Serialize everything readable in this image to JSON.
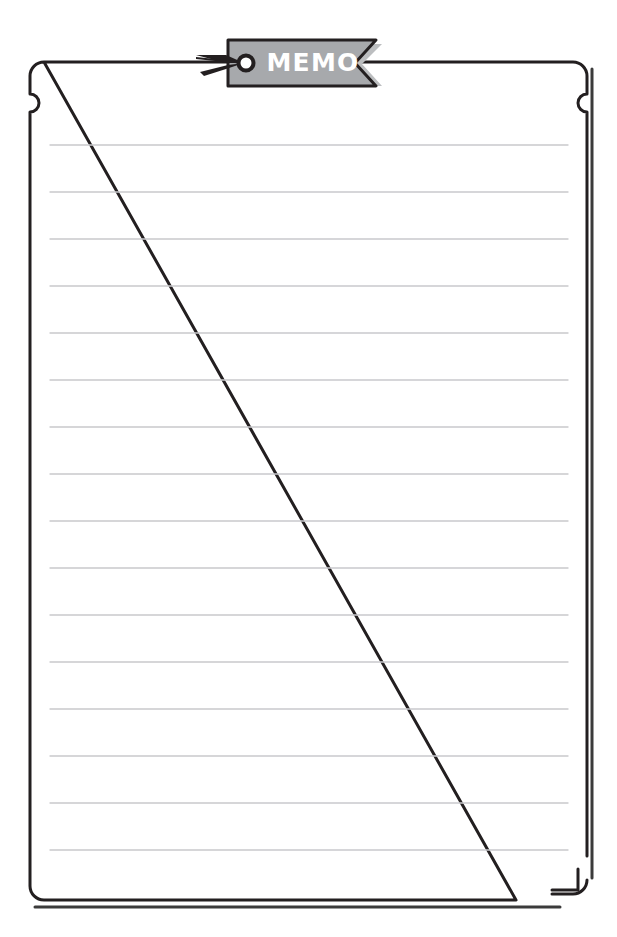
{
  "page": {
    "title": "MEMO",
    "width": 617,
    "height": 937,
    "background_color": "#ffffff"
  },
  "sheet": {
    "name": "memo-sheet",
    "fill_color": "#ffffff",
    "border_color": "#231f20",
    "border_width": 3,
    "shadow_color": "#3b3b3b",
    "corner_radius": 14,
    "bounds": {
      "left": 30,
      "top": 62,
      "right": 587,
      "bottom": 900
    },
    "notch": {
      "name": "edge-notch",
      "shape": "semicircle",
      "radius": 9,
      "center_y": 103
    },
    "dog_ear": {
      "name": "dog-ear-corner",
      "corner": "bottom-right",
      "gap_size": 40
    }
  },
  "ruled_lines": {
    "name": "ruled-lines",
    "color": "#c9c9cc",
    "thickness": 1.4,
    "x_start": 50,
    "x_end": 568,
    "spacing": 47,
    "count": 16,
    "y_positions": [
      145,
      192,
      239,
      286,
      333,
      380,
      427,
      474,
      521,
      568,
      615,
      662,
      709,
      756,
      803,
      850
    ]
  },
  "tag": {
    "name": "memo-tag",
    "label": "MEMO",
    "fill_color": "#a7a9ac",
    "text_color": "#ffffff",
    "outline_color": "#231f20",
    "shadow_color": "#bcbec0",
    "eyelet": {
      "name": "eyelet-hole",
      "ring_color": "#231f20",
      "hole_color": "#ffffff",
      "radius": 7
    },
    "pin": {
      "name": "pin-arrow-icon",
      "color": "#231f20",
      "direction": "right"
    },
    "notch": {
      "name": "tag-chevron-notch",
      "shape": "chevron",
      "side": "right"
    }
  }
}
